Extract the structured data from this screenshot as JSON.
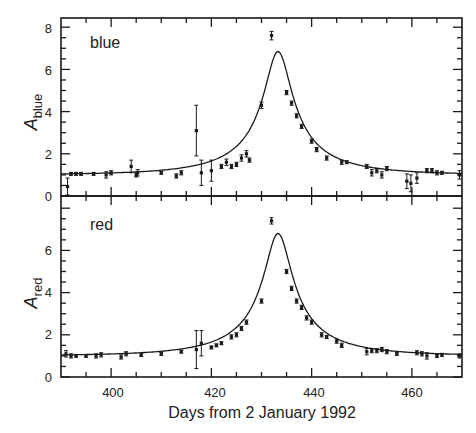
{
  "chart_data": [
    {
      "type": "scatter",
      "panel": "top",
      "label": "blue",
      "ylabel": "A_blue",
      "ylabel_main": "A",
      "ylabel_sub": "blue",
      "xlabel": "Days from 2 January 1992",
      "xlim": [
        390,
        470
      ],
      "ylim": [
        0,
        8.4
      ],
      "yticks": [
        0,
        2,
        4,
        6,
        8
      ],
      "xticks": [
        400,
        420,
        440,
        460
      ],
      "fit_curve": {
        "t0": 433.3,
        "Amax": 6.85,
        "u0": 0.148,
        "tE": 19.0
      },
      "points": [
        {
          "x": 391.3,
          "y": 0.45,
          "err": 0.4
        },
        {
          "x": 392.0,
          "y": 1.05,
          "err": 0.05
        },
        {
          "x": 393.0,
          "y": 1.05,
          "err": 0.05
        },
        {
          "x": 394.0,
          "y": 1.05,
          "err": 0.05
        },
        {
          "x": 396.5,
          "y": 1.05,
          "err": 0.05
        },
        {
          "x": 399.0,
          "y": 1.0,
          "err": 0.15
        },
        {
          "x": 400.0,
          "y": 1.1,
          "err": 0.1
        },
        {
          "x": 404.0,
          "y": 1.4,
          "err": 0.3
        },
        {
          "x": 405.0,
          "y": 1.0,
          "err": 0.1
        },
        {
          "x": 405.3,
          "y": 1.1,
          "err": 0.15
        },
        {
          "x": 410.0,
          "y": 1.1,
          "err": 0.05
        },
        {
          "x": 413.0,
          "y": 0.95,
          "err": 0.1
        },
        {
          "x": 414.0,
          "y": 1.1,
          "err": 0.1
        },
        {
          "x": 417.0,
          "y": 3.1,
          "err": 1.2
        },
        {
          "x": 418.0,
          "y": 1.1,
          "err": 0.6
        },
        {
          "x": 420.0,
          "y": 1.2,
          "err": 0.5
        },
        {
          "x": 422.0,
          "y": 1.4,
          "err": 0.1
        },
        {
          "x": 423.0,
          "y": 1.6,
          "err": 0.15
        },
        {
          "x": 424.0,
          "y": 1.4,
          "err": 0.1
        },
        {
          "x": 425.0,
          "y": 1.5,
          "err": 0.1
        },
        {
          "x": 426.0,
          "y": 1.8,
          "err": 0.15
        },
        {
          "x": 427.0,
          "y": 2.0,
          "err": 0.15
        },
        {
          "x": 427.6,
          "y": 1.7,
          "err": 0.1
        },
        {
          "x": 430.0,
          "y": 4.3,
          "err": 0.15
        },
        {
          "x": 432.0,
          "y": 7.6,
          "err": 0.2
        },
        {
          "x": 435.0,
          "y": 4.9,
          "err": 0.1
        },
        {
          "x": 436.0,
          "y": 4.4,
          "err": 0.1
        },
        {
          "x": 437.0,
          "y": 3.8,
          "err": 0.1
        },
        {
          "x": 438.0,
          "y": 3.3,
          "err": 0.1
        },
        {
          "x": 440.0,
          "y": 2.6,
          "err": 0.1
        },
        {
          "x": 441.0,
          "y": 2.2,
          "err": 0.1
        },
        {
          "x": 443.0,
          "y": 1.8,
          "err": 0.1
        },
        {
          "x": 446.0,
          "y": 1.6,
          "err": 0.1
        },
        {
          "x": 447.0,
          "y": 1.6,
          "err": 0.05
        },
        {
          "x": 451.0,
          "y": 1.4,
          "err": 0.1
        },
        {
          "x": 452.0,
          "y": 1.1,
          "err": 0.15
        },
        {
          "x": 453.0,
          "y": 1.2,
          "err": 0.1
        },
        {
          "x": 454.0,
          "y": 1.0,
          "err": 0.15
        },
        {
          "x": 455.0,
          "y": 1.3,
          "err": 0.1
        },
        {
          "x": 459.0,
          "y": 0.7,
          "err": 0.35
        },
        {
          "x": 459.8,
          "y": 0.6,
          "err": 0.4
        },
        {
          "x": 461.0,
          "y": 0.85,
          "err": 0.25
        },
        {
          "x": 463.0,
          "y": 1.2,
          "err": 0.1
        },
        {
          "x": 464.0,
          "y": 1.2,
          "err": 0.1
        },
        {
          "x": 465.0,
          "y": 1.1,
          "err": 0.1
        },
        {
          "x": 466.0,
          "y": 1.1,
          "err": 0.05
        },
        {
          "x": 469.5,
          "y": 1.0,
          "err": 0.2
        }
      ]
    },
    {
      "type": "scatter",
      "panel": "bottom",
      "label": "red",
      "ylabel": "A_red",
      "ylabel_main": "A",
      "ylabel_sub": "red",
      "xlabel": "Days from 2 January 1992",
      "xlim": [
        390,
        470
      ],
      "ylim": [
        0,
        8.6
      ],
      "yticks": [
        0,
        2,
        4,
        6
      ],
      "xticks": [
        400,
        420,
        440,
        460
      ],
      "xtick_labels": [
        "400",
        "420",
        "440",
        "460"
      ],
      "fit_curve": {
        "t0": 433.3,
        "Amax": 6.8,
        "u0": 0.149,
        "tE": 19.0
      },
      "points": [
        {
          "x": 391.0,
          "y": 1.1,
          "err": 0.15
        },
        {
          "x": 392.0,
          "y": 1.0,
          "err": 0.1
        },
        {
          "x": 393.0,
          "y": 1.0,
          "err": 0.05
        },
        {
          "x": 395.0,
          "y": 1.0,
          "err": 0.05
        },
        {
          "x": 397.0,
          "y": 1.0,
          "err": 0.1
        },
        {
          "x": 398.0,
          "y": 1.05,
          "err": 0.1
        },
        {
          "x": 402.0,
          "y": 0.95,
          "err": 0.1
        },
        {
          "x": 403.0,
          "y": 1.1,
          "err": 0.1
        },
        {
          "x": 406.0,
          "y": 1.05,
          "err": 0.05
        },
        {
          "x": 410.0,
          "y": 1.1,
          "err": 0.05
        },
        {
          "x": 414.0,
          "y": 1.2,
          "err": 0.05
        },
        {
          "x": 417.0,
          "y": 1.3,
          "err": 0.9
        },
        {
          "x": 418.0,
          "y": 1.6,
          "err": 0.6
        },
        {
          "x": 420.0,
          "y": 1.4,
          "err": 0.05
        },
        {
          "x": 421.0,
          "y": 1.5,
          "err": 0.05
        },
        {
          "x": 422.0,
          "y": 1.6,
          "err": 0.05
        },
        {
          "x": 424.0,
          "y": 1.9,
          "err": 0.1
        },
        {
          "x": 425.0,
          "y": 2.0,
          "err": 0.1
        },
        {
          "x": 426.0,
          "y": 2.3,
          "err": 0.1
        },
        {
          "x": 427.0,
          "y": 2.6,
          "err": 0.1
        },
        {
          "x": 430.0,
          "y": 3.6,
          "err": 0.1
        },
        {
          "x": 432.0,
          "y": 7.4,
          "err": 0.15
        },
        {
          "x": 435.0,
          "y": 5.0,
          "err": 0.1
        },
        {
          "x": 436.0,
          "y": 4.2,
          "err": 0.1
        },
        {
          "x": 437.0,
          "y": 3.6,
          "err": 0.1
        },
        {
          "x": 438.0,
          "y": 3.3,
          "err": 0.1
        },
        {
          "x": 439.0,
          "y": 2.8,
          "err": 0.1
        },
        {
          "x": 440.0,
          "y": 2.6,
          "err": 0.1
        },
        {
          "x": 442.0,
          "y": 2.0,
          "err": 0.1
        },
        {
          "x": 443.0,
          "y": 1.9,
          "err": 0.05
        },
        {
          "x": 445.0,
          "y": 1.7,
          "err": 0.1
        },
        {
          "x": 446.0,
          "y": 1.5,
          "err": 0.1
        },
        {
          "x": 451.0,
          "y": 1.2,
          "err": 0.15
        },
        {
          "x": 452.0,
          "y": 1.25,
          "err": 0.1
        },
        {
          "x": 453.0,
          "y": 1.25,
          "err": 0.1
        },
        {
          "x": 454.0,
          "y": 1.3,
          "err": 0.1
        },
        {
          "x": 455.0,
          "y": 1.2,
          "err": 0.1
        },
        {
          "x": 457.0,
          "y": 1.1,
          "err": 0.05
        },
        {
          "x": 461.0,
          "y": 1.15,
          "err": 0.1
        },
        {
          "x": 462.0,
          "y": 1.1,
          "err": 0.1
        },
        {
          "x": 463.0,
          "y": 1.0,
          "err": 0.15
        },
        {
          "x": 465.0,
          "y": 1.0,
          "err": 0.05
        },
        {
          "x": 466.0,
          "y": 1.05,
          "err": 0.05
        },
        {
          "x": 469.5,
          "y": 1.0,
          "err": 0.1
        }
      ]
    }
  ],
  "figure": {
    "xlabel": "Days from 2 January 1992",
    "panel_labels": [
      "blue",
      "red"
    ],
    "top_yticks": [
      "0",
      "2",
      "4",
      "6",
      "8"
    ],
    "bottom_yticks": [
      "0",
      "2",
      "4",
      "6"
    ],
    "xtick_labels": [
      "400",
      "420",
      "440",
      "460"
    ]
  }
}
